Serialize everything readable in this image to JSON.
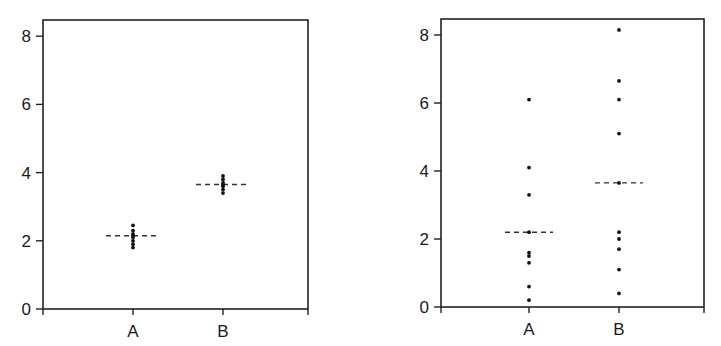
{
  "chart_data": [
    {
      "type": "scatter",
      "subtype": "dot-plot",
      "title": "",
      "xlabel": "",
      "ylabel": "",
      "categories": [
        "A",
        "B"
      ],
      "ylim": [
        0,
        8.5
      ],
      "yticks": [
        0,
        2,
        4,
        6,
        8
      ],
      "grid": false,
      "legend": null,
      "series": [
        {
          "name": "A",
          "values": [
            2.45,
            2.3,
            2.2,
            2.15,
            2.1,
            2.0,
            1.9,
            1.8
          ],
          "median": 2.15
        },
        {
          "name": "B",
          "values": [
            3.9,
            3.8,
            3.7,
            3.65,
            3.6,
            3.5,
            3.4
          ],
          "median": 3.65
        }
      ],
      "annotations": "Dashed horizontal line marks each group's mean/median; points are tightly clustered (low variance)."
    },
    {
      "type": "scatter",
      "subtype": "dot-plot",
      "title": "",
      "xlabel": "",
      "ylabel": "",
      "categories": [
        "A",
        "B"
      ],
      "ylim": [
        0,
        8.5
      ],
      "yticks": [
        0,
        2,
        4,
        6,
        8
      ],
      "grid": false,
      "legend": null,
      "series": [
        {
          "name": "A",
          "values": [
            6.1,
            4.1,
            3.3,
            2.2,
            1.6,
            1.5,
            1.3,
            0.6,
            0.2
          ],
          "median": 2.2
        },
        {
          "name": "B",
          "values": [
            8.15,
            6.65,
            6.1,
            5.1,
            3.65,
            2.2,
            2.0,
            1.7,
            1.1,
            0.4
          ],
          "median": 3.65
        }
      ],
      "annotations": "Dashed horizontal line marks each group's mean/median; points are widely spread (high variance)."
    }
  ],
  "panels": [
    {
      "frame": {
        "left": 43,
        "top": 20,
        "right": 308,
        "bottom": 309
      },
      "y_pixel_at_0": 309,
      "px_per_unit": 34.1,
      "x_positions": [
        133,
        223
      ],
      "median_half_width": 27
    },
    {
      "frame": {
        "left": 441,
        "top": 19,
        "right": 704,
        "bottom": 307
      },
      "y_pixel_at_0": 307,
      "px_per_unit": 34.0,
      "x_positions": [
        529,
        619
      ],
      "median_half_width": 24
    }
  ],
  "style": {
    "axis_color": "#222222",
    "point_color": "#111111",
    "median_color": "#333333",
    "label_color": "#1a1a1a"
  }
}
